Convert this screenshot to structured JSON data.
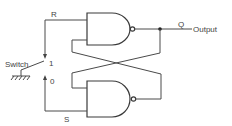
{
  "diagram": {
    "labels": {
      "r": "R",
      "s": "S",
      "q": "Q",
      "output": "Output",
      "switch": "Switch",
      "pos1": "1",
      "pos0": "0"
    },
    "components": [
      {
        "type": "nand-gate",
        "id": "top-gate"
      },
      {
        "type": "nand-gate",
        "id": "bottom-gate"
      },
      {
        "type": "spdt-switch",
        "id": "switch"
      },
      {
        "type": "ground",
        "id": "ground"
      }
    ],
    "colors": {
      "line": "#4a4a4a",
      "background": "#ffffff"
    }
  }
}
